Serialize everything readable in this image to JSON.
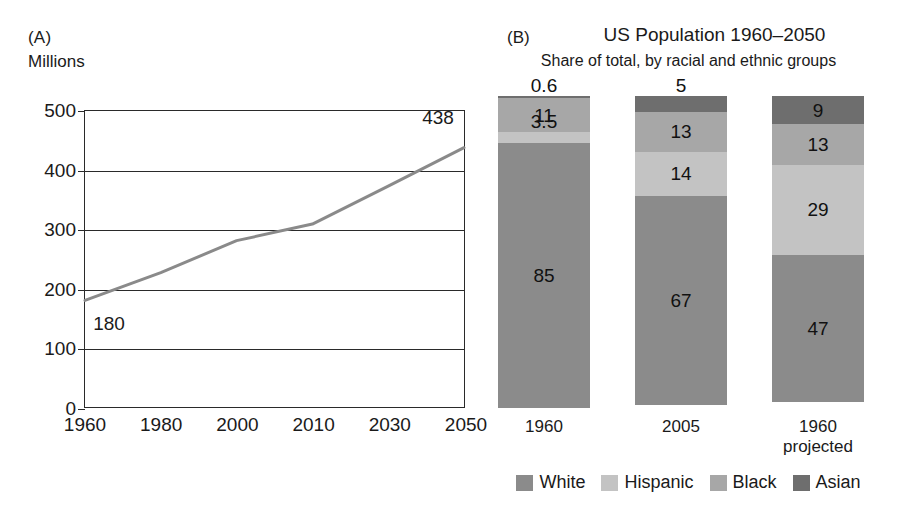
{
  "panel_a": {
    "tag": "(A)",
    "axis_title": "Millions"
  },
  "panel_b": {
    "tag": "(B)",
    "title": "US Population 1960–2050",
    "subtitle": "Share of total, by racial and ethnic groups"
  },
  "colors": {
    "white_group": "#8b8b8b",
    "hispanic_group": "#c3c3c3",
    "black_group": "#a7a7a7",
    "asian_group": "#6e6e6e",
    "line": "#8a8a8a",
    "axis": "#2a2a2a"
  },
  "chart_data": [
    {
      "type": "line",
      "panel": "(A)",
      "title": "",
      "xlabel": "",
      "ylabel": "Millions",
      "ylim": [
        0,
        500
      ],
      "yticks": [
        0,
        100,
        200,
        300,
        400,
        500
      ],
      "ytick_labels": [
        "0",
        "100",
        "200",
        "300",
        "400",
        "500"
      ],
      "categories": [
        "1960",
        "1980",
        "2000",
        "2010",
        "2030",
        "2050"
      ],
      "x": [
        "1960",
        "1980",
        "2000",
        "2010",
        "2030",
        "2050"
      ],
      "values": [
        180,
        227,
        281,
        309,
        373,
        438
      ],
      "grid": true,
      "grid_axis": "y",
      "legend": "none",
      "annotations": [
        {
          "text": "180",
          "x": "1960",
          "y": 180,
          "position": "below-right"
        },
        {
          "text": "438",
          "x": "2050",
          "y": 438,
          "position": "above-left"
        }
      ]
    },
    {
      "type": "bar",
      "subtype": "stacked",
      "panel": "(B)",
      "title": "US Population 1960–2050",
      "subtitle": "Share of total, by racial and ethnic groups",
      "xlabel": "",
      "ylabel": "",
      "ylim": [
        0,
        100
      ],
      "grid": false,
      "legend": "bottom",
      "categories": [
        "1960",
        "2005",
        "1960 projected"
      ],
      "category_lines": [
        [
          "1960"
        ],
        [
          "2005"
        ],
        [
          "1960",
          "projected"
        ]
      ],
      "stack_order_top_to_bottom": [
        "Asian",
        "Black",
        "Hispanic",
        "White"
      ],
      "series": [
        {
          "name": "White",
          "color": "#8b8b8b",
          "values": [
            85,
            67,
            47
          ],
          "labels": [
            "85",
            "67",
            "47"
          ]
        },
        {
          "name": "Hispanic",
          "color": "#c3c3c3",
          "values": [
            3.5,
            14,
            29
          ],
          "labels": [
            "3.5",
            "14",
            "29"
          ]
        },
        {
          "name": "Black",
          "color": "#a7a7a7",
          "values": [
            11,
            13,
            13
          ],
          "labels": [
            "11",
            "13",
            "13"
          ]
        },
        {
          "name": "Asian",
          "color": "#6e6e6e",
          "values": [
            0.6,
            5,
            9
          ],
          "labels": [
            "0.6",
            "5",
            "9"
          ]
        }
      ],
      "legend_entries": [
        {
          "label": "White",
          "color": "#8b8b8b"
        },
        {
          "label": "Hispanic",
          "color": "#c3c3c3"
        },
        {
          "label": "Black",
          "color": "#a7a7a7"
        },
        {
          "label": "Asian",
          "color": "#6e6e6e"
        }
      ]
    }
  ]
}
